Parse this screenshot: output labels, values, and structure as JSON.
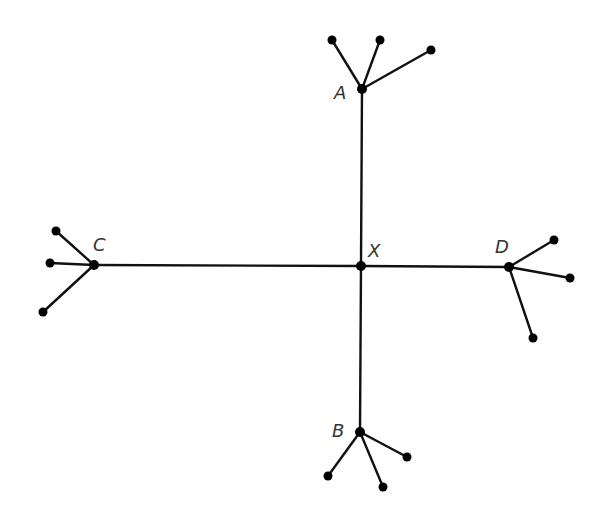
{
  "diagram": {
    "type": "tree",
    "colors": {
      "edge": "#111111",
      "node": "#000000",
      "label": "#333333",
      "background": "#ffffff"
    },
    "center": {
      "id": "X",
      "label": "X",
      "x": 361,
      "y": 266,
      "label_x": 368,
      "label_y": 242
    },
    "hubs": [
      {
        "id": "A",
        "label": "A",
        "x": 362,
        "y": 89,
        "label_x": 334,
        "label_y": 84,
        "leaves": [
          {
            "x": 332,
            "y": 40
          },
          {
            "x": 380,
            "y": 40
          },
          {
            "x": 431,
            "y": 50
          }
        ]
      },
      {
        "id": "B",
        "label": "B",
        "x": 360,
        "y": 432,
        "label_x": 332,
        "label_y": 422,
        "leaves": [
          {
            "x": 328,
            "y": 476
          },
          {
            "x": 383,
            "y": 487
          },
          {
            "x": 407,
            "y": 457
          }
        ]
      },
      {
        "id": "C",
        "label": "C",
        "x": 94,
        "y": 265,
        "label_x": 93,
        "label_y": 236,
        "leaves": [
          {
            "x": 56,
            "y": 231
          },
          {
            "x": 50,
            "y": 263
          },
          {
            "x": 43,
            "y": 312
          }
        ]
      },
      {
        "id": "D",
        "label": "D",
        "x": 509,
        "y": 267,
        "label_x": 495,
        "label_y": 238,
        "leaves": [
          {
            "x": 554,
            "y": 240
          },
          {
            "x": 570,
            "y": 278
          },
          {
            "x": 533,
            "y": 338
          }
        ]
      }
    ]
  }
}
